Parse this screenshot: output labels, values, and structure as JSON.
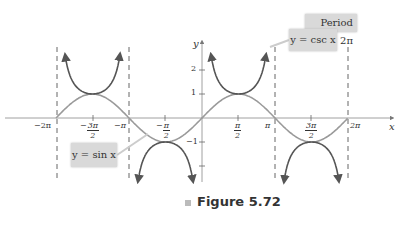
{
  "caption": {
    "prefix": "Figure",
    "number": "5.72",
    "text": "Figure 5.72"
  },
  "labels": {
    "period": "Period 2π",
    "csc": "y = csc x",
    "sin": "y = sin x"
  },
  "axes": {
    "x_label": "x",
    "y_label": "y",
    "x_ticks": [
      {
        "label": "−2π",
        "value": -6.283
      },
      {
        "num": "3π",
        "den": "2",
        "sign": "−",
        "value": -4.712
      },
      {
        "label": "−π",
        "value": -3.1416
      },
      {
        "num": "π",
        "den": "2",
        "sign": "−",
        "value": -1.5708
      },
      {
        "num": "π",
        "den": "2",
        "sign": "",
        "value": 1.5708
      },
      {
        "label": "π",
        "value": 3.1416
      },
      {
        "num": "3π",
        "den": "2",
        "sign": "",
        "value": 4.712
      },
      {
        "label": "2π",
        "value": 6.283
      }
    ],
    "y_ticks": [
      {
        "label": "2",
        "value": 2
      },
      {
        "label": "1",
        "value": 1
      },
      {
        "label": "−1",
        "value": -1
      }
    ]
  },
  "chart_data": {
    "type": "line",
    "title": "Figure 5.72",
    "xlabel": "x",
    "ylabel": "y",
    "xlim": [
      -6.8,
      7.2
    ],
    "ylim": [
      -2.2,
      3.1
    ],
    "grid": false,
    "series": [
      {
        "name": "y = sin x",
        "domain": [
          -6.283,
          6.283
        ],
        "color": "#9a9a9a"
      },
      {
        "name": "y = csc x",
        "branches": [
          [
            -6.1,
            -3.3
          ],
          [
            -2.98,
            -0.16
          ],
          [
            0.16,
            2.98
          ],
          [
            3.3,
            6.1
          ]
        ],
        "color": "#555555"
      }
    ],
    "asymptotes": [
      -6.283,
      -3.1416,
      3.1416,
      6.283
    ],
    "annotations": [
      "Period 2π",
      "y = csc x",
      "y = sin x"
    ]
  }
}
